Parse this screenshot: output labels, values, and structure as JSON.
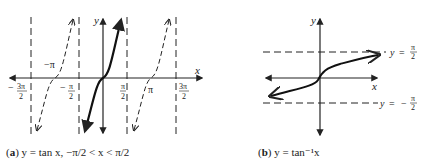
{
  "figure_a": {
    "caption_label": "a",
    "caption_text": "y = tan x, −π/2 < x < π/2",
    "axis_x_label": "x",
    "axis_y_label": "y",
    "tick_labels": [
      "−3π/2",
      "−π/2",
      "π/2",
      "3π/2"
    ],
    "point_labels": [
      "−π",
      "π"
    ]
  },
  "figure_b": {
    "caption_label": "b",
    "caption_text": "y = tan⁻¹x",
    "axis_x_label": "x",
    "axis_y_label": "y",
    "asymptote_labels": [
      "y = π/2",
      "y = −π/2"
    ]
  },
  "colors": {
    "ink": "#222222",
    "background": "#ffffff"
  }
}
